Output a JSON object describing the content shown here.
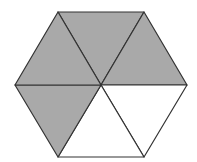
{
  "diagram": {
    "shape": "regular hexagon divided into 6 equilateral triangles",
    "total_parts": 6,
    "shaded_parts": 4,
    "shaded_fraction": "4/6",
    "shade_color": "#a9a9a9",
    "unshaded_color": "#ffffff",
    "stroke_color": "#333333",
    "vertices": {
      "center": [
        101,
        85
      ],
      "top_left": [
        58,
        12
      ],
      "top_right": [
        144,
        12
      ],
      "right": [
        187,
        85
      ],
      "bottom_right": [
        144,
        157
      ],
      "bottom_left": [
        58,
        157
      ],
      "left": [
        15,
        85
      ]
    },
    "triangles": [
      {
        "name": "top",
        "shaded": true
      },
      {
        "name": "top-right",
        "shaded": true
      },
      {
        "name": "bottom-right",
        "shaded": false
      },
      {
        "name": "bottom",
        "shaded": false
      },
      {
        "name": "bottom-left",
        "shaded": true
      },
      {
        "name": "top-left",
        "shaded": true
      }
    ]
  }
}
